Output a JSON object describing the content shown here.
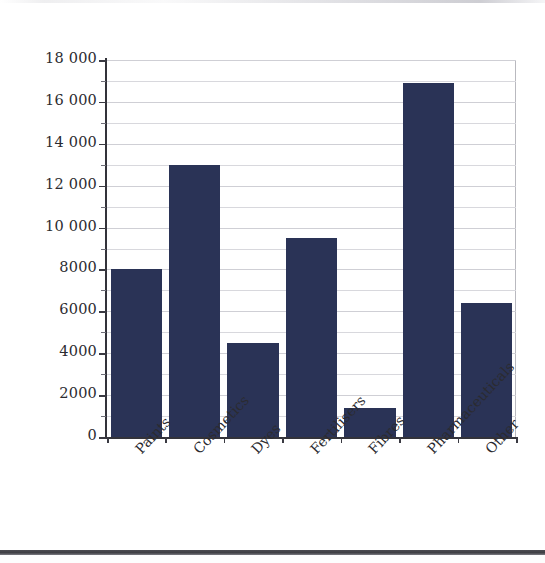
{
  "chart_data": {
    "type": "bar",
    "title": "",
    "subtitle": "",
    "xlabel": "",
    "ylabel": "Number of people employed",
    "categories": [
      "Paints",
      "Cosmetics",
      "Dyes",
      "Fertilisers",
      "Fibres",
      "Pharmaceuticals",
      "Other"
    ],
    "values": [
      8000,
      13000,
      4500,
      9500,
      1400,
      16900,
      6400
    ],
    "ylim": [
      0,
      18000
    ],
    "ytick_values": [
      0,
      2000,
      4000,
      6000,
      8000,
      10000,
      12000,
      14000,
      16000,
      18000
    ],
    "ytick_labels": [
      "0",
      "2000",
      "4000",
      "6000",
      "8000",
      "10 000",
      "12 000",
      "14 000",
      "16 000",
      "18 000"
    ],
    "minor_tick_interval": 1000,
    "grid": true,
    "grid_axis": "y",
    "legend": false,
    "legend_position": "none",
    "bar_color": "#2a3356",
    "axis_color": "#33333a",
    "gridline_color": "#d8d8dd",
    "background_color": "#ffffff"
  },
  "axes": {
    "y_title": "Number of people employed"
  }
}
